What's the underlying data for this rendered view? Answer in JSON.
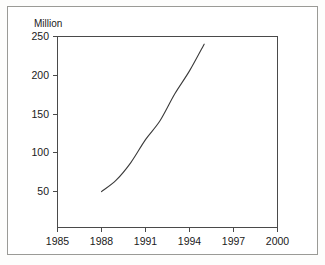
{
  "chart_data": {
    "type": "line",
    "title": "",
    "subtitle": "",
    "ylabel": "Million",
    "xlabel": "",
    "xlim": [
      1985,
      2000
    ],
    "ylim": [
      0,
      250
    ],
    "grid": false,
    "legend": false,
    "x_ticks": [
      "1985",
      "1988",
      "1991",
      "1994",
      "1997",
      "2000"
    ],
    "y_ticks": [
      "50",
      "100",
      "150",
      "200",
      "250"
    ],
    "x": [
      1988,
      1989,
      1990,
      1991,
      1992,
      1993,
      1994,
      1995
    ],
    "values": [
      47,
      62,
      85,
      115,
      140,
      175,
      205,
      240
    ],
    "series": [
      {
        "name": "",
        "x": [
          1988,
          1989,
          1990,
          1991,
          1992,
          1993,
          1994,
          1995
        ],
        "values": [
          47,
          62,
          85,
          115,
          140,
          175,
          205,
          240
        ]
      }
    ],
    "line_color": "#3a3a3a"
  },
  "axes": {
    "y_axis_unit_label": "Million",
    "y_tick_labels": [
      "250",
      "200",
      "150",
      "100",
      "50"
    ],
    "x_tick_labels": [
      "1985",
      "1988",
      "1991",
      "1994",
      "1997",
      "2000"
    ]
  },
  "colors": {
    "frame": "#4a4a4a",
    "outer_border": "#9a9a96",
    "text": "#1a1a1a",
    "background": "#ffffff",
    "line": "#3a3a3a"
  }
}
